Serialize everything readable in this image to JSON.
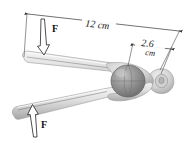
{
  "figure": {
    "background_color": "#ffffff"
  },
  "dimensions": {
    "length_label": "12 cm",
    "jaw_label_value": "2.6",
    "jaw_label_unit": "cm"
  },
  "forces": {
    "top_label": "F",
    "bottom_label": "F",
    "top_direction": "down",
    "bottom_direction": "up"
  },
  "colors": {
    "tool_light": "#e9e9e9",
    "tool_mid": "#cfcfcf",
    "tool_shadow": "#a8a8a8",
    "nut_fill": "#8d8d8d",
    "nut_highlight": "#b9b9b9",
    "line": "#333333",
    "text": "#1a1a1a"
  },
  "parts": {
    "upper_handle": "upper-handle",
    "lower_handle": "lower-handle",
    "nut": "nut-sphere",
    "pivot": "pivot-hinge"
  }
}
